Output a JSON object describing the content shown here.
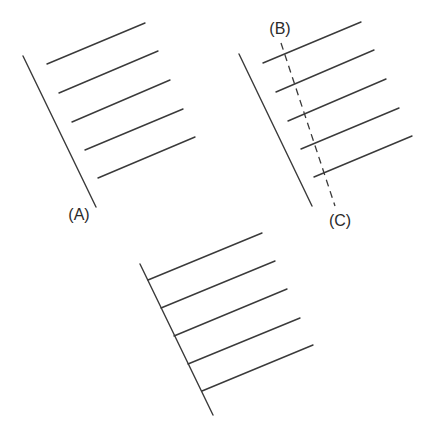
{
  "diagram": {
    "stroke_color": "#3a3a3a",
    "background": "#ffffff",
    "figures": [
      {
        "id": "figure-a",
        "label": "(A)",
        "label_pos": [
          79,
          215
        ],
        "baseline": [
          [
            23,
            56
          ],
          [
            96,
            207
          ]
        ],
        "hatch_lines": [
          [
            [
              47,
              64
            ],
            [
              145,
              23
            ]
          ],
          [
            [
              59,
              93
            ],
            [
              158,
              51
            ]
          ],
          [
            [
              72,
              122
            ],
            [
              170,
              80
            ]
          ],
          [
            [
              85,
              150
            ],
            [
              183,
              109
            ]
          ],
          [
            [
              98,
              178
            ],
            [
              195,
              137
            ]
          ]
        ],
        "hatch_touch_baseline": false
      },
      {
        "id": "figure-bc",
        "label_top": "(B)",
        "label_top_pos": [
          280,
          29
        ],
        "label_bottom": "(C)",
        "label_bottom_pos": [
          340,
          221
        ],
        "baseline": [
          [
            239,
            54
          ],
          [
            312,
            206
          ]
        ],
        "hatch_lines": [
          [
            [
              263,
              63
            ],
            [
              361,
              22
            ]
          ],
          [
            [
              276,
              92
            ],
            [
              374,
              50
            ]
          ],
          [
            [
              288,
              121
            ],
            [
              386,
              79
            ]
          ],
          [
            [
              301,
              149
            ],
            [
              399,
              108
            ]
          ],
          [
            [
              314,
              177
            ],
            [
              412,
              136
            ]
          ]
        ],
        "dashed_line": [
          [
            281,
            43
          ],
          [
            335,
            206
          ]
        ],
        "hatch_touch_baseline": false
      },
      {
        "id": "figure-bottom",
        "baseline": [
          [
            140,
            264
          ],
          [
            213,
            415
          ]
        ],
        "hatch_lines": [
          [
            [
              148,
              280
            ],
            [
              262,
              233
            ]
          ],
          [
            [
              161,
              308
            ],
            [
              275,
              261
            ]
          ],
          [
            [
              174,
              336
            ],
            [
              287,
              289
            ]
          ],
          [
            [
              188,
              364
            ],
            [
              300,
              318
            ]
          ],
          [
            [
              202,
              391
            ],
            [
              313,
              345
            ]
          ]
        ],
        "hatch_touch_baseline": true
      }
    ]
  }
}
